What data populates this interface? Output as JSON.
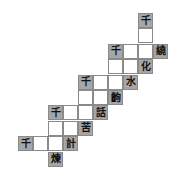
{
  "puzzle": {
    "origin_x": 18,
    "origin_y": 13,
    "cell_w": 15,
    "cell_h": 15.4,
    "colors": {
      "shaded": "#a6a6a6",
      "border": "#8a8a8a"
    },
    "cells": [
      {
        "row": 0,
        "col": 8,
        "char": "千",
        "shaded": true
      },
      {
        "row": 1,
        "col": 8,
        "char": "",
        "shaded": false
      },
      {
        "row": 2,
        "col": 6,
        "char": "千",
        "shaded": true
      },
      {
        "row": 2,
        "col": 7,
        "char": "",
        "shaded": false
      },
      {
        "row": 2,
        "col": 8,
        "char": "",
        "shaded": false
      },
      {
        "row": 2,
        "col": 9,
        "char": "繞",
        "shaded": true
      },
      {
        "row": 3,
        "col": 6,
        "char": "",
        "shaded": false
      },
      {
        "row": 3,
        "col": 7,
        "char": "",
        "shaded": false
      },
      {
        "row": 3,
        "col": 8,
        "char": "化",
        "shaded": true
      },
      {
        "row": 4,
        "col": 4,
        "char": "千",
        "shaded": true
      },
      {
        "row": 4,
        "col": 5,
        "char": "",
        "shaded": false
      },
      {
        "row": 4,
        "col": 6,
        "char": "",
        "shaded": false
      },
      {
        "row": 4,
        "col": 7,
        "char": "水",
        "shaded": true
      },
      {
        "row": 5,
        "col": 4,
        "char": "",
        "shaded": false
      },
      {
        "row": 5,
        "col": 5,
        "char": "",
        "shaded": false
      },
      {
        "row": 5,
        "col": 6,
        "char": "齣",
        "shaded": true
      },
      {
        "row": 6,
        "col": 2,
        "char": "千",
        "shaded": true
      },
      {
        "row": 6,
        "col": 3,
        "char": "",
        "shaded": false
      },
      {
        "row": 6,
        "col": 4,
        "char": "",
        "shaded": false
      },
      {
        "row": 6,
        "col": 5,
        "char": "話",
        "shaded": true
      },
      {
        "row": 7,
        "col": 2,
        "char": "",
        "shaded": false
      },
      {
        "row": 7,
        "col": 3,
        "char": "",
        "shaded": false
      },
      {
        "row": 7,
        "col": 4,
        "char": "苦",
        "shaded": true
      },
      {
        "row": 8,
        "col": 0,
        "char": "千",
        "shaded": true
      },
      {
        "row": 8,
        "col": 1,
        "char": "",
        "shaded": false
      },
      {
        "row": 8,
        "col": 2,
        "char": "",
        "shaded": false
      },
      {
        "row": 8,
        "col": 3,
        "char": "計",
        "shaded": true
      },
      {
        "row": 9,
        "col": 2,
        "char": "煉",
        "shaded": true
      }
    ]
  }
}
